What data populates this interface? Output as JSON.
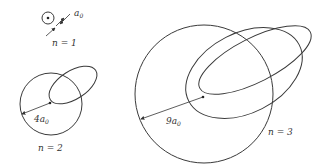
{
  "diagram": {
    "colors": {
      "line": "#3a3a3a",
      "background": "#ffffff"
    },
    "panels": [
      {
        "n_label": "n = 1",
        "radius_label": "a",
        "radius_sub": "0",
        "radius_text": "a0"
      },
      {
        "n_label": "n = 2",
        "radius_label": "4a",
        "radius_sub": "0",
        "radius_text": "4a0"
      },
      {
        "n_label": "n = 3",
        "radius_label": "9a",
        "radius_sub": "0",
        "radius_text": "9a0"
      }
    ]
  }
}
